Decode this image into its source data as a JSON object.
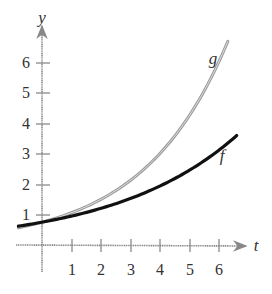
{
  "chart_data": {
    "type": "line",
    "title": "",
    "xlabel": "t",
    "ylabel": "y",
    "xlim": [
      -0.8,
      6.9
    ],
    "ylim": [
      -0.5,
      7.0
    ],
    "grid": false,
    "x_ticks": [
      "1",
      "2",
      "3",
      "4",
      "5",
      "6"
    ],
    "y_ticks": [
      "1",
      "2",
      "3",
      "4",
      "5",
      "6"
    ],
    "series": [
      {
        "name": "g",
        "color": "#9a9a9a",
        "style": "double gray line",
        "x": [
          -0.8,
          0,
          1,
          2,
          3,
          4,
          5,
          6,
          6.3
        ],
        "values": [
          0.57,
          0.75,
          1.06,
          1.5,
          2.13,
          3.0,
          4.25,
          6.0,
          6.7
        ]
      },
      {
        "name": "f",
        "color": "#111111",
        "style": "solid black line",
        "x": [
          -0.8,
          0,
          1,
          2,
          3,
          4,
          5,
          6,
          6.6
        ],
        "values": [
          0.61,
          0.75,
          0.93,
          1.16,
          1.44,
          1.79,
          2.22,
          2.76,
          3.6
        ]
      }
    ],
    "annotations": [
      {
        "text": "g",
        "near": [
          5.9,
          6.5
        ]
      },
      {
        "text": "f",
        "near": [
          6.2,
          3.8
        ]
      }
    ]
  },
  "labels": {
    "x_axis": "t",
    "y_axis": "y",
    "curve_g": "g",
    "curve_f": "f",
    "xt1": "1",
    "xt2": "2",
    "xt3": "3",
    "xt4": "4",
    "xt5": "5",
    "xt6": "6",
    "yt1": "1",
    "yt2": "2",
    "yt3": "3",
    "yt4": "4",
    "yt5": "5",
    "yt6": "6"
  }
}
